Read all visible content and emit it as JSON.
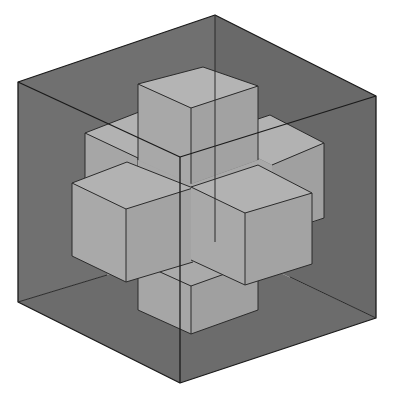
{
  "figure": {
    "colors": {
      "background": "#ffffff",
      "outer_cube_fill": "#6e6e6e",
      "inner_cube_fill": "#a9a9a9",
      "edge": "#1a1a1a"
    },
    "outer_cube": {
      "vertices": {
        "top": [
          215,
          15
        ],
        "left_top": [
          18,
          82
        ],
        "right_top": [
          376,
          96
        ],
        "inner_corner": [
          180,
          157
        ],
        "left_bottom": [
          18,
          302
        ],
        "right_bottom": [
          376,
          318
        ],
        "bottom": [
          180,
          383
        ],
        "back_bottom": [
          215,
          242
        ]
      }
    },
    "inner_cubes": [
      {
        "name": "top-cube"
      },
      {
        "name": "back-left-cube"
      },
      {
        "name": "back-right-cube"
      },
      {
        "name": "left-cube"
      },
      {
        "name": "right-cube"
      },
      {
        "name": "bottom-cube"
      }
    ]
  }
}
